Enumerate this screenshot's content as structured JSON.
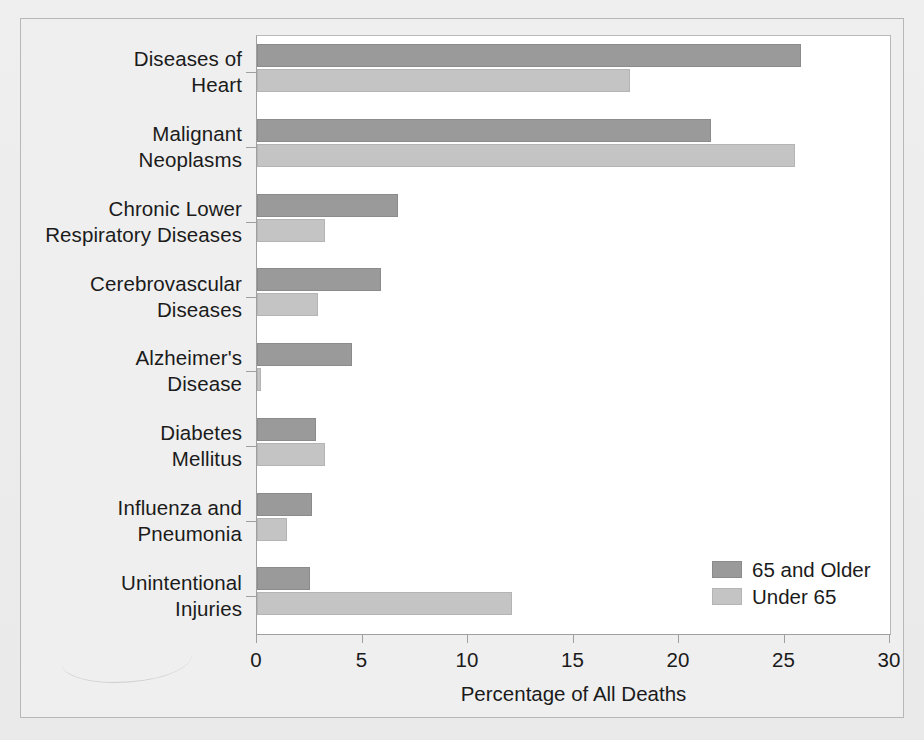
{
  "chart_data": {
    "type": "bar",
    "orientation": "horizontal",
    "title": "",
    "xlabel": "Percentage of All Deaths",
    "ylabel": "",
    "xlim": [
      0,
      30
    ],
    "xticks": [
      0,
      5,
      10,
      15,
      20,
      25,
      30
    ],
    "grid": false,
    "legend_position": "inside-bottom-right",
    "categories": [
      "Diseases of Heart",
      "Malignant Neoplasms",
      "Chronic Lower Respiratory Diseases",
      "Cerebrovascular Diseases",
      "Alzheimer's Disease",
      "Diabetes Mellitus",
      "Influenza and Pneumonia",
      "Unintentional Injuries"
    ],
    "category_lines": [
      [
        "Diseases of",
        "Heart"
      ],
      [
        "Malignant",
        "Neoplasms"
      ],
      [
        "Chronic Lower",
        "Respiratory Diseases"
      ],
      [
        "Cerebrovascular",
        "Diseases"
      ],
      [
        "Alzheimer's",
        "Disease"
      ],
      [
        "Diabetes",
        "Mellitus"
      ],
      [
        "Influenza and",
        "Pneumonia"
      ],
      [
        "Unintentional",
        "Injuries"
      ]
    ],
    "series": [
      {
        "name": "65 and Older",
        "color": "#9a9a9a",
        "values": [
          25.8,
          21.5,
          6.7,
          5.9,
          4.5,
          2.8,
          2.6,
          2.5
        ]
      },
      {
        "name": "Under 65",
        "color": "#c4c4c4",
        "values": [
          17.7,
          25.5,
          3.2,
          2.9,
          0.2,
          3.2,
          1.4,
          12.1
        ]
      }
    ]
  },
  "legend": {
    "items": [
      {
        "label": "65 and Older",
        "swatch": "older"
      },
      {
        "label": "Under 65",
        "swatch": "under"
      }
    ]
  },
  "axis": {
    "x_title": "Percentage of All Deaths",
    "x_tick_labels": [
      "0",
      "5",
      "10",
      "15",
      "20",
      "25",
      "30"
    ]
  },
  "colors": {
    "series_older": "#9a9a9a",
    "series_under": "#c4c4c4",
    "plot_background": "#ffffff",
    "page_background": "#efefef",
    "axis_line": "#9f9f9f",
    "text": "#1b1b1b"
  }
}
